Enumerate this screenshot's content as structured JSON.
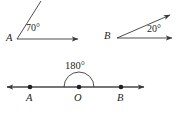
{
  "figure": {
    "background_color": "#ffffff",
    "stroke_color": "#3a3a3c",
    "text_color": "#231f20",
    "panels": [
      {
        "id": "acute-angle-a",
        "name": "acute-angle-at-a",
        "vertex_label": "A",
        "vertex_label_x": 6,
        "vertex_label_y": 33,
        "vertex_x": 17,
        "vertex_y": 39,
        "angle_label": "70°",
        "angle_label_x": 26,
        "angle_label_y": 23,
        "rays": [
          {
            "name": "ray-a-horizontal",
            "to_x": 81,
            "to_y": 39,
            "arrowhead": true,
            "direction_degrees": 0
          },
          {
            "name": "ray-a-upper",
            "to_x": 41,
            "to_y": 1,
            "arrowhead": false,
            "direction_degrees": 70
          }
        ]
      },
      {
        "id": "acute-angle-b",
        "name": "acute-angle-at-b",
        "vertex_label": "B",
        "vertex_label_x": 104,
        "vertex_label_y": 31,
        "vertex_x": 117,
        "vertex_y": 38,
        "angle_label": "20°",
        "angle_label_x": 147,
        "angle_label_y": 24,
        "rays": [
          {
            "name": "ray-b-horizontal",
            "to_x": 175,
            "to_y": 38,
            "arrowhead": true,
            "direction_degrees": 0
          },
          {
            "name": "ray-b-upper",
            "to_x": 174,
            "to_y": 13,
            "arrowhead": true,
            "direction_degrees": 20
          }
        ]
      },
      {
        "id": "straight-angle-o",
        "name": "straight-angle-at-o",
        "angle_label": "180°",
        "angle_label_x": 65,
        "angle_label_y": 61,
        "line_y": 87,
        "line_left_x": 4,
        "line_right_x": 147,
        "left_arrowhead": true,
        "right_arrowhead": true,
        "arc_radius": 15,
        "points": [
          {
            "name": "point-a",
            "label": "A",
            "x": 30,
            "y": 87,
            "label_x": 26,
            "label_y": 93
          },
          {
            "name": "point-o",
            "label": "O",
            "x": 79,
            "y": 87,
            "label_x": 74,
            "label_y": 93
          },
          {
            "name": "point-b",
            "label": "B",
            "x": 121,
            "y": 87,
            "label_x": 117,
            "label_y": 93
          }
        ]
      }
    ]
  }
}
